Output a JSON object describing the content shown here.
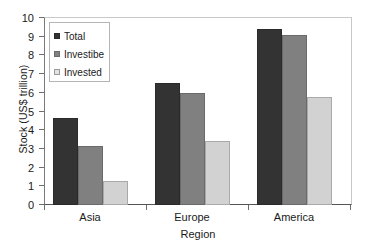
{
  "chart_data": {
    "type": "bar",
    "title": "",
    "xlabel": "Region",
    "ylabel": "Stock (US$ trillion)",
    "categories": [
      "Asia",
      "Europe",
      "America"
    ],
    "series": [
      {
        "name": "Total",
        "color": "#333333",
        "values": [
          4.65,
          6.55,
          9.4
        ]
      },
      {
        "name": "Investibe",
        "color": "#808080",
        "values": [
          3.15,
          6.0,
          9.08
        ]
      },
      {
        "name": "Invested",
        "color": "#d2d2d2",
        "values": [
          1.27,
          3.42,
          5.75
        ]
      }
    ],
    "ylim": [
      0,
      10
    ],
    "ytick_labels": [
      "10",
      "9",
      "8",
      "7",
      "6",
      "5",
      "4",
      "3",
      "2",
      "1",
      "0"
    ],
    "ytick_values": [
      10,
      9,
      8,
      7,
      6,
      5,
      4,
      3,
      2,
      1,
      0
    ],
    "grid": false,
    "legend_position": "top-left"
  }
}
